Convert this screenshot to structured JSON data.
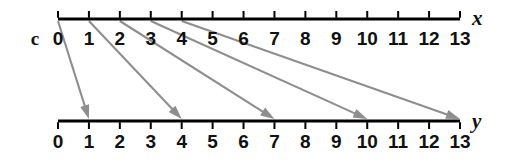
{
  "diagram": {
    "kind": "mapping-diagram",
    "set_label": "c",
    "colors": {
      "axis": "#000000",
      "arrow": "#8e8e8e",
      "text": "#111111",
      "background": "#ffffff"
    },
    "axes": [
      {
        "id": "x-axis",
        "name": "x",
        "ticks": [
          "0",
          "1",
          "2",
          "3",
          "4",
          "5",
          "6",
          "7",
          "8",
          "9",
          "10",
          "11",
          "12",
          "13"
        ],
        "tick_direction": "up",
        "label_position": "below",
        "min": 0,
        "max": 13
      },
      {
        "id": "y-axis",
        "name": "y",
        "ticks": [
          "0",
          "1",
          "2",
          "3",
          "4",
          "5",
          "6",
          "7",
          "8",
          "9",
          "10",
          "11",
          "12",
          "13"
        ],
        "tick_direction": "down",
        "label_position": "below",
        "min": 0,
        "max": 13
      }
    ],
    "arrows": [
      {
        "from": 0,
        "to": 1
      },
      {
        "from": 1,
        "to": 4
      },
      {
        "from": 2,
        "to": 7
      },
      {
        "from": 3,
        "to": 10
      },
      {
        "from": 4,
        "to": 13
      }
    ]
  }
}
